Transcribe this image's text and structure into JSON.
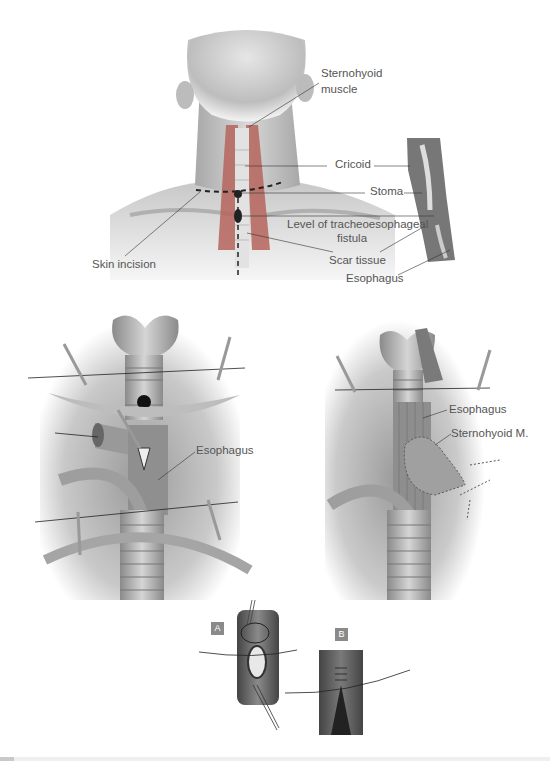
{
  "figure": {
    "top_panel": {
      "labels": {
        "sternohyoid": "Sternohyoid\nmuscle",
        "sternohyoid_line1": "Sternohyoid",
        "sternohyoid_line2": "muscle",
        "cricoid": "Cricoid",
        "stoma": "Stoma",
        "tef_line1": "Level of tracheoesophageal",
        "tef_line2": "fistula",
        "scar": "Scar tissue",
        "esophagus": "Esophagus",
        "skin_incision": "Skin incision"
      }
    },
    "middle_left_panel": {
      "labels": {
        "esophagus": "Esophagus"
      }
    },
    "middle_right_panel": {
      "labels": {
        "esophagus": "Esophagus",
        "sternohyoid": "Sternohyoid M."
      }
    },
    "inset_panels": [
      {
        "tag": "A"
      },
      {
        "tag": "B"
      }
    ],
    "colors": {
      "muscle_red": "#b5655c",
      "line_dark": "#222222",
      "tissue_gray": "#9a9a9a",
      "tag_gray": "#8a8a8a"
    }
  }
}
